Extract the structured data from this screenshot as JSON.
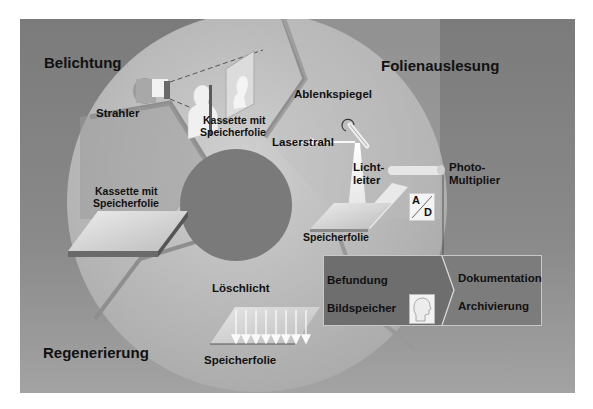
{
  "phases": {
    "exposure": "Belichtung",
    "readout": "Folienauslesung",
    "regeneration": "Regenerierung"
  },
  "labels": {
    "source": "Strahler",
    "cassette_top_line1": "Kassette mit",
    "cassette_top_line2": "Speicherfolie",
    "cassette_left_line1": "Kassette mit",
    "cassette_left_line2": "Speicherfolie",
    "deflection_mirror": "Ablenkspiegel",
    "laser_beam": "Laserstrahl",
    "light_guide_line1": "Licht-",
    "light_guide_line2": "leiter",
    "photomultiplier_line1": "Photo-",
    "photomultiplier_line2": "Multiplier",
    "plate_readout": "Speicherfolie",
    "erase_light": "Löschlicht",
    "plate_erase": "Speicherfolie",
    "ad_top": "A",
    "ad_bottom": "D"
  },
  "output_box": {
    "left": [
      "Befundung",
      "Bildspeicher"
    ],
    "right": [
      "Dokumentation",
      "Archivierung"
    ]
  },
  "colors": {
    "background": "#7b7b7b",
    "ring": "#b4b4b4",
    "ring_light": "#c8c8c8",
    "hub": "#7a7a7a",
    "box": "#6e6e6e",
    "text": "#111111"
  }
}
